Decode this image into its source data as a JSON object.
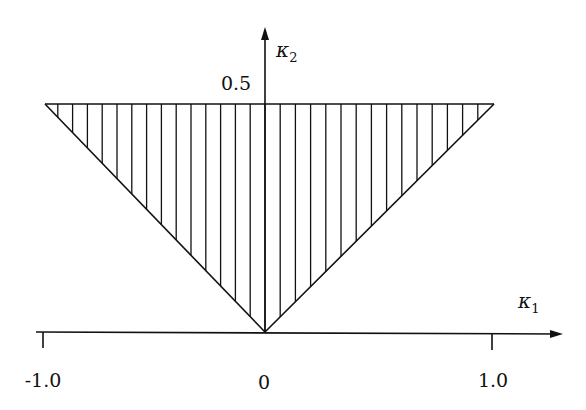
{
  "diagram": {
    "title": "",
    "x_axis": {
      "label_symbol": "κ",
      "label_subscript": "1",
      "ticks": [
        {
          "value": -1.0,
          "label": "-1.0"
        },
        {
          "value": 0,
          "label": "0"
        },
        {
          "value": 1.0,
          "label": "1.0"
        }
      ]
    },
    "y_axis": {
      "label_symbol": "κ",
      "label_subscript": "2",
      "ticks": [
        {
          "value": 0.5,
          "label": "0.5"
        }
      ]
    },
    "region": {
      "shape": "triangle",
      "vertices": [
        [
          -1.0,
          0.5
        ],
        [
          1.0,
          0.5
        ],
        [
          0,
          0
        ]
      ],
      "fill": "vertical hatching",
      "description": "Shaded region |κ1| ≤ 2κ2, κ2 ≤ 0.5"
    },
    "colors": {
      "ink": "#111111",
      "background": "#ffffff"
    }
  }
}
